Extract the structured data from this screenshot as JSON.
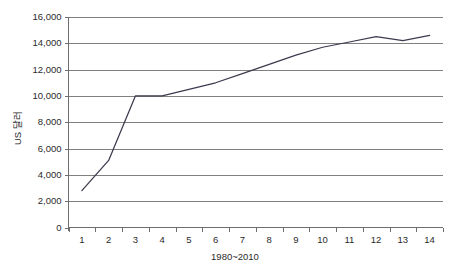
{
  "chart_data": {
    "type": "line",
    "title": "",
    "xlabel": "1980~2010",
    "ylabel": "US 달러",
    "categories": [
      "1",
      "2",
      "3",
      "4",
      "5",
      "6",
      "7",
      "8",
      "9",
      "10",
      "11",
      "12",
      "13",
      "14"
    ],
    "values": [
      2800,
      5100,
      10000,
      10000,
      10500,
      11000,
      11700,
      12400,
      13100,
      13700,
      14100,
      14500,
      14200,
      14600
    ],
    "series": [
      {
        "name": "US 달러",
        "values": [
          2800,
          5100,
          10000,
          10000,
          10500,
          11000,
          11700,
          12400,
          13100,
          13700,
          14100,
          14500,
          14200,
          14600
        ]
      }
    ],
    "ylim": [
      0,
      16000
    ],
    "ytick_labels": [
      "16,000",
      "14,000",
      "12,000",
      "10,000",
      "8,000",
      "6,000",
      "4,000",
      "2,000",
      "0"
    ],
    "ytick_values": [
      16000,
      14000,
      12000,
      10000,
      8000,
      6000,
      4000,
      2000,
      0
    ],
    "ytick_step": 2000,
    "grid": true,
    "grid_axis": "y",
    "legend": false,
    "legend_position": "none",
    "line_color": "#3b3b4f",
    "grid_color": "#808080",
    "axis_color": "#6e6e6e",
    "background_color": "#ffffff"
  }
}
